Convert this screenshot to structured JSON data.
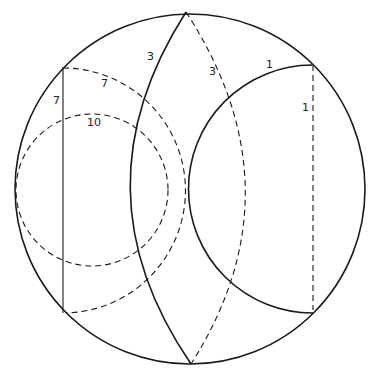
{
  "diagram": {
    "colors": {
      "stroke": "#1a1a1a",
      "background": "#ffffff",
      "label": "#222222"
    },
    "labels": [
      {
        "id": "lens-left-label",
        "text": "3",
        "x": 147,
        "y": 60
      },
      {
        "id": "lens-right-label",
        "text": "3",
        "x": 209,
        "y": 75
      },
      {
        "id": "right-arc-label",
        "text": "1",
        "x": 266,
        "y": 68
      },
      {
        "id": "right-vertical-label",
        "text": "1",
        "x": 302,
        "y": 111
      },
      {
        "id": "left-vertical-label",
        "text": "7",
        "x": 53,
        "y": 104
      },
      {
        "id": "arc-seven-label",
        "text": "7",
        "x": 101,
        "y": 87
      },
      {
        "id": "circle-ten-label",
        "text": "10",
        "x": 87,
        "y": 126
      }
    ]
  }
}
